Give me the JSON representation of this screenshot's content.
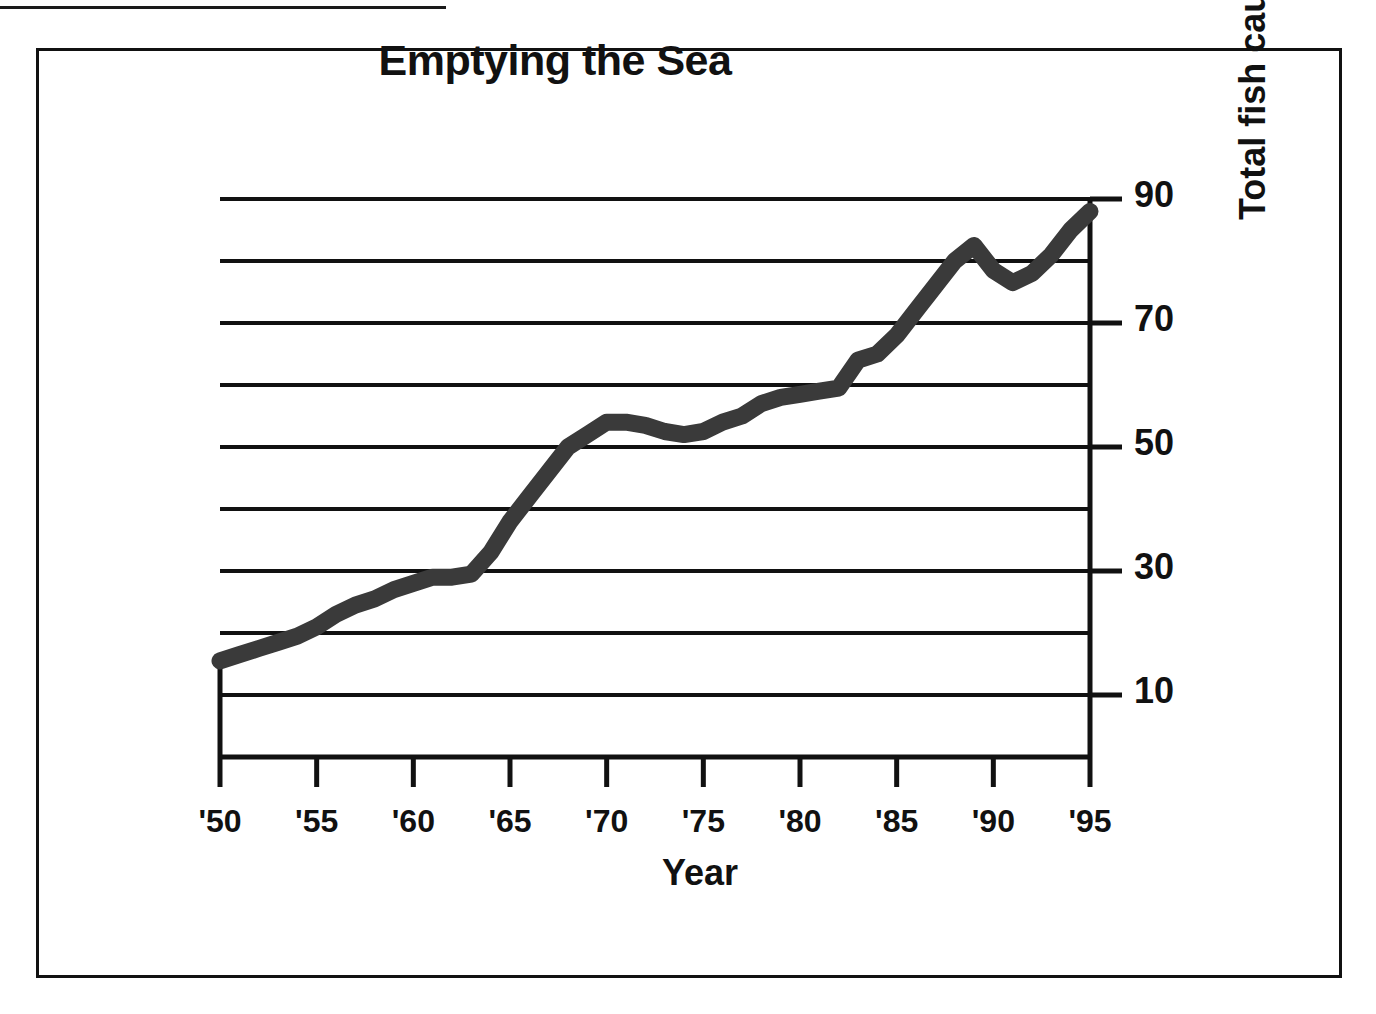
{
  "figure": {
    "title": "Emptying the Sea",
    "x_axis_title": "Year",
    "y_axis_title": "Total fish caught in millions of tons"
  },
  "chart_data": {
    "type": "line",
    "title": "Emptying the Sea",
    "xlabel": "Year",
    "ylabel": "Total fish caught in millions of tons",
    "xlim": [
      1950,
      1995
    ],
    "ylim": [
      0,
      90
    ],
    "grid": true,
    "grid_interval": 10,
    "legend": "none",
    "x_tick_labels": [
      "'50",
      "'55",
      "'60",
      "'65",
      "'70",
      "'75",
      "'80",
      "'85",
      "'90",
      "'95"
    ],
    "x_tick_values": [
      1950,
      1955,
      1960,
      1965,
      1970,
      1975,
      1980,
      1985,
      1990,
      1995
    ],
    "y_tick_labels": [
      "10",
      "30",
      "50",
      "70",
      "90"
    ],
    "y_tick_values": [
      10,
      30,
      50,
      70,
      90
    ],
    "y_minor_gridlines": [
      20,
      40,
      60,
      80
    ],
    "series": [
      {
        "name": "Total world fish catch",
        "units": "millions of tons",
        "color": "#3a3a3a",
        "x": [
          1950,
          1951,
          1952,
          1953,
          1954,
          1955,
          1956,
          1957,
          1958,
          1959,
          1960,
          1961,
          1962,
          1963,
          1964,
          1965,
          1966,
          1967,
          1968,
          1969,
          1970,
          1971,
          1972,
          1973,
          1974,
          1975,
          1976,
          1977,
          1978,
          1979,
          1980,
          1981,
          1982,
          1983,
          1984,
          1985,
          1986,
          1987,
          1988,
          1989,
          1990,
          1991,
          1992,
          1993,
          1994,
          1995
        ],
        "values": [
          15.5,
          16.5,
          17.5,
          18.5,
          19.5,
          21,
          23,
          24.5,
          25.5,
          27,
          28,
          29,
          29,
          29.5,
          33,
          38,
          42,
          46,
          50,
          52,
          54,
          54,
          53.5,
          52.5,
          52,
          52.5,
          54,
          55,
          57,
          58,
          58.5,
          59,
          59.5,
          64,
          65,
          68,
          72,
          76,
          80,
          82.5,
          78.5,
          76.5,
          78,
          81,
          85,
          88
        ]
      }
    ]
  },
  "geometry": {
    "plot_left_px": 220,
    "plot_right_px": 1090,
    "y_zero_px": 757,
    "px_per_unit": 6.2
  }
}
